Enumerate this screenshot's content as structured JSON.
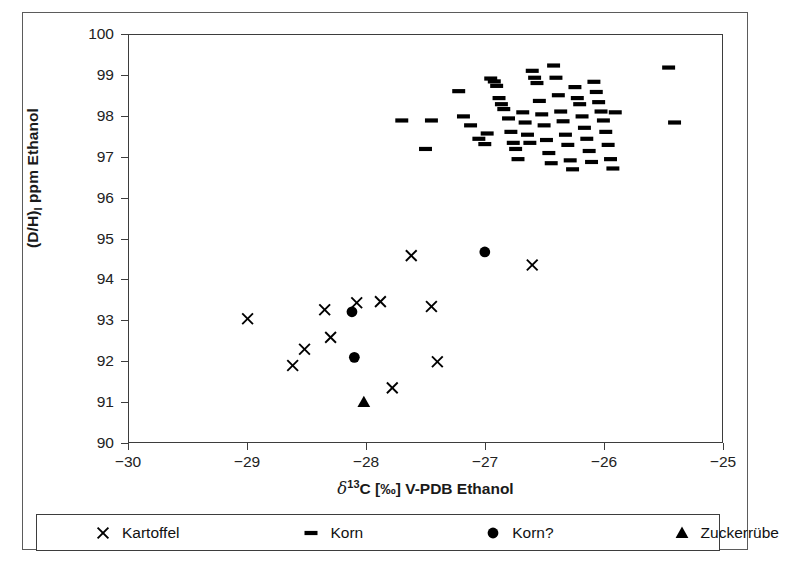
{
  "axes": {
    "y_title_main": "(D/H)",
    "y_title_sub": "I",
    "y_title_rest": " ppm Ethanol",
    "x_title_delta": "δ",
    "x_title_sup": "13",
    "x_title_rest": "C [‰] V-PDB Ethanol",
    "y_ticks": [
      "100",
      "99",
      "98",
      "97",
      "96",
      "95",
      "94",
      "93",
      "92",
      "91",
      "90"
    ],
    "x_ticks": [
      "−30",
      "−29",
      "−28",
      "−27",
      "−26",
      "−25"
    ]
  },
  "legend": {
    "items": [
      {
        "symbol": "×",
        "label": "Kartoffel",
        "marker": "cross"
      },
      {
        "symbol": "–",
        "label": "Korn",
        "marker": "dash"
      },
      {
        "symbol": "●",
        "label": "Korn?",
        "marker": "circle"
      },
      {
        "symbol": "▲",
        "label": "Zuckerrübe",
        "marker": "triangle"
      }
    ]
  },
  "colors": {
    "marker": "#000000",
    "frame": "#3d3d3d",
    "outer_frame": "#5b5b5b",
    "background": "#ffffff",
    "text": "#1a1a1a"
  },
  "chart_data": {
    "type": "scatter",
    "title": "",
    "xlabel": "δ13C [‰] V-PDB Ethanol",
    "ylabel": "(D/H)I ppm Ethanol",
    "xlim": [
      -30,
      -25
    ],
    "ylim": [
      90,
      100
    ],
    "xticks": [
      -30,
      -29,
      -28,
      -27,
      -26,
      -25
    ],
    "yticks": [
      90,
      91,
      92,
      93,
      94,
      95,
      96,
      97,
      98,
      99,
      100
    ],
    "grid": false,
    "legend_position": "below-axis",
    "series": [
      {
        "name": "Kartoffel",
        "marker": "cross",
        "points": [
          [
            -29.0,
            93.03
          ],
          [
            -28.62,
            91.88
          ],
          [
            -28.52,
            92.28
          ],
          [
            -28.35,
            93.25
          ],
          [
            -28.3,
            92.57
          ],
          [
            -28.08,
            93.42
          ],
          [
            -27.88,
            93.45
          ],
          [
            -27.78,
            91.33
          ],
          [
            -27.62,
            94.58
          ],
          [
            -27.45,
            93.33
          ],
          [
            -27.4,
            91.97
          ],
          [
            -26.6,
            94.35
          ]
        ]
      },
      {
        "name": "Korn?",
        "marker": "circle",
        "points": [
          [
            -28.12,
            93.2
          ],
          [
            -28.1,
            92.08
          ],
          [
            -27.0,
            94.67
          ]
        ]
      },
      {
        "name": "Zuckerrübe",
        "marker": "triangle",
        "points": [
          [
            -28.02,
            90.98
          ]
        ]
      },
      {
        "name": "Korn",
        "marker": "dash",
        "points": [
          [
            -27.7,
            97.9
          ],
          [
            -27.45,
            97.9
          ],
          [
            -27.5,
            97.2
          ],
          [
            -27.22,
            98.62
          ],
          [
            -27.18,
            98.0
          ],
          [
            -27.12,
            97.78
          ],
          [
            -27.05,
            97.45
          ],
          [
            -27.0,
            97.32
          ],
          [
            -26.98,
            97.58
          ],
          [
            -26.95,
            98.93
          ],
          [
            -26.92,
            98.86
          ],
          [
            -26.9,
            98.75
          ],
          [
            -26.88,
            98.45
          ],
          [
            -26.86,
            98.3
          ],
          [
            -26.84,
            98.18
          ],
          [
            -26.8,
            97.95
          ],
          [
            -26.78,
            97.62
          ],
          [
            -26.76,
            97.35
          ],
          [
            -26.74,
            97.2
          ],
          [
            -26.72,
            96.95
          ],
          [
            -26.68,
            98.1
          ],
          [
            -26.66,
            97.85
          ],
          [
            -26.64,
            97.55
          ],
          [
            -26.62,
            97.35
          ],
          [
            -26.6,
            99.12
          ],
          [
            -26.58,
            98.95
          ],
          [
            -26.56,
            98.82
          ],
          [
            -26.54,
            98.38
          ],
          [
            -26.52,
            98.05
          ],
          [
            -26.5,
            97.78
          ],
          [
            -26.48,
            97.42
          ],
          [
            -26.46,
            97.1
          ],
          [
            -26.44,
            96.85
          ],
          [
            -26.42,
            99.25
          ],
          [
            -26.4,
            98.95
          ],
          [
            -26.38,
            98.52
          ],
          [
            -26.36,
            98.12
          ],
          [
            -26.34,
            97.88
          ],
          [
            -26.32,
            97.55
          ],
          [
            -26.3,
            97.3
          ],
          [
            -26.28,
            96.92
          ],
          [
            -26.26,
            96.7
          ],
          [
            -26.24,
            98.72
          ],
          [
            -26.22,
            98.45
          ],
          [
            -26.2,
            98.3
          ],
          [
            -26.18,
            98.0
          ],
          [
            -26.16,
            97.72
          ],
          [
            -26.14,
            97.45
          ],
          [
            -26.12,
            97.15
          ],
          [
            -26.1,
            96.88
          ],
          [
            -26.08,
            98.85
          ],
          [
            -26.06,
            98.6
          ],
          [
            -26.04,
            98.35
          ],
          [
            -26.02,
            98.12
          ],
          [
            -26.0,
            97.9
          ],
          [
            -25.98,
            97.62
          ],
          [
            -25.96,
            97.3
          ],
          [
            -25.94,
            96.95
          ],
          [
            -25.92,
            96.72
          ],
          [
            -25.9,
            98.1
          ],
          [
            -25.45,
            99.2
          ],
          [
            -25.4,
            97.85
          ]
        ]
      }
    ]
  }
}
